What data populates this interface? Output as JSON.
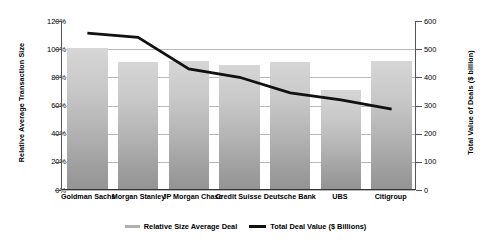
{
  "chart_data": {
    "type": "bar",
    "title": "",
    "categories": [
      "Goldman Sachs",
      "Morgan Stanley",
      "JP Morgan Chase",
      "Credit Suisse",
      "Deutsche Bank",
      "UBS",
      "Citigroup"
    ],
    "series": [
      {
        "name": "Relative Size Average Deal",
        "type": "bar",
        "axis": "left",
        "values": [
          100,
          90,
          91,
          88,
          90,
          70,
          91
        ],
        "unit": "%"
      },
      {
        "name": "Total Deal Value ($ Billions)",
        "type": "line",
        "axis": "right",
        "values": [
          557,
          542,
          430,
          400,
          345,
          320,
          287
        ],
        "unit": "$ billion"
      }
    ],
    "xlabel": "",
    "ylabel": "Relative Average Transaction Size",
    "y2label": "Total Value of Deals ($ billion)",
    "ylim": [
      0,
      120
    ],
    "y2lim": [
      0,
      600
    ],
    "yticks": [
      "0%",
      "20%",
      "40%",
      "60%",
      "80%",
      "100%",
      "120%"
    ],
    "y2ticks": [
      "0",
      "100",
      "200",
      "300",
      "400",
      "500",
      "600"
    ],
    "grid": true,
    "legend_position": "bottom"
  },
  "legend": {
    "items": [
      {
        "label": "Relative Size Average Deal",
        "swatch": "bar-swatch",
        "color": "#b0b0b0"
      },
      {
        "label": "Total Deal Value ($ Billions)",
        "swatch": "line-swatch",
        "color": "#111111"
      }
    ]
  },
  "colors": {
    "bar_light": "#d6d6d6",
    "bar_dark": "#949494",
    "line": "#111111",
    "grid": "#b9b9b9",
    "axis": "#555555"
  }
}
